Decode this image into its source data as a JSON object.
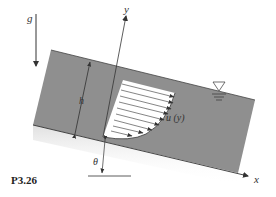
{
  "figure": {
    "label": "P3.26",
    "gravity_label": "g",
    "x_axis_label": "x",
    "y_axis_label": "y",
    "depth_label": "h",
    "profile_label": "u (y)",
    "angle_label": "θ",
    "free_surface_symbol": "free-surface-triangle"
  },
  "colors": {
    "fluid": "#8f8f8f",
    "line": "#333333",
    "background": "#ffffff"
  }
}
